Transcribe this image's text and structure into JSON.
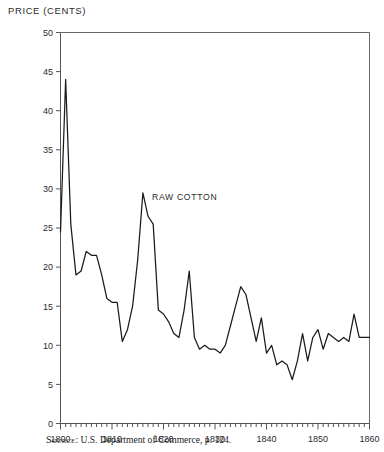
{
  "figure": {
    "axis_title": "PRICE (CENTS)",
    "annotation": "RAW COTTON",
    "source_prefix": "Source",
    "source_text": ": U.S. Department of Commerce, p. 124.",
    "line_color": "#1a1a1a",
    "axis_color": "#555555"
  },
  "chart_data": {
    "type": "line",
    "title": "",
    "subtitle": "",
    "xlabel": "",
    "ylabel": "PRICE (CENTS)",
    "xlim": [
      1800,
      1860
    ],
    "ylim": [
      0,
      50
    ],
    "grid": false,
    "legend": false,
    "annotations": [
      {
        "text": "RAW COTTON",
        "x": 1817,
        "y": 29
      }
    ],
    "source": "Source: U.S. Department of Commerce, p. 124.",
    "xticks": [
      1800,
      1810,
      1820,
      1830,
      1840,
      1850,
      1860
    ],
    "xtick_labels": [
      "1800",
      "1810",
      "1820",
      "1830",
      "1840",
      "1850",
      "1860"
    ],
    "xminor_interval": 1,
    "yticks": [
      0,
      5,
      10,
      15,
      20,
      25,
      30,
      35,
      40,
      45,
      50
    ],
    "ytick_labels": [
      "0",
      "5",
      "10",
      "15",
      "20",
      "25",
      "30",
      "35",
      "40",
      "45",
      "50"
    ],
    "series": [
      {
        "name": "RAW COTTON",
        "x": [
          1800,
          1801,
          1802,
          1803,
          1804,
          1805,
          1806,
          1807,
          1808,
          1809,
          1810,
          1811,
          1812,
          1813,
          1814,
          1815,
          1816,
          1817,
          1818,
          1819,
          1820,
          1821,
          1822,
          1823,
          1824,
          1825,
          1826,
          1827,
          1828,
          1829,
          1830,
          1831,
          1832,
          1833,
          1834,
          1835,
          1836,
          1837,
          1838,
          1839,
          1840,
          1841,
          1842,
          1843,
          1844,
          1845,
          1846,
          1847,
          1848,
          1849,
          1850,
          1851,
          1852,
          1853,
          1854,
          1855,
          1856,
          1857,
          1858,
          1859,
          1860
        ],
        "values": [
          24.5,
          44.0,
          25.5,
          19.0,
          19.5,
          22.0,
          21.5,
          21.5,
          19.0,
          16.0,
          15.5,
          15.5,
          10.5,
          12.0,
          15.0,
          21.0,
          29.5,
          26.5,
          25.5,
          14.5,
          14.0,
          13.0,
          11.5,
          11.0,
          14.5,
          19.5,
          11.0,
          9.5,
          10.0,
          9.5,
          9.5,
          9.0,
          10.0,
          12.5,
          15.0,
          17.5,
          16.5,
          13.5,
          10.5,
          13.5,
          9.0,
          10.0,
          7.5,
          8.0,
          7.5,
          5.6,
          8.0,
          11.5,
          8.0,
          11.0,
          12.0,
          9.5,
          11.5,
          11.0,
          10.5,
          11.0,
          10.5,
          14.0,
          11.0,
          11.0,
          11.0
        ]
      }
    ]
  }
}
